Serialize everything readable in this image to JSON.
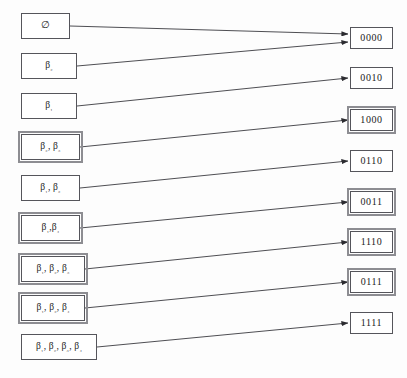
{
  "diagram": {
    "type": "bipartite-mapping",
    "stroke_color": "#3a3a3f",
    "box_border_color": "#55555b",
    "box_double_border_color": "#8d8d92",
    "background_color": "#fdfdfd"
  },
  "left_nodes": [
    {
      "id": "L0",
      "label": "∅",
      "border": "single",
      "x": 21,
      "y": 13,
      "w": 49,
      "h": 26
    },
    {
      "id": "L1",
      "label": "β₂",
      "border": "single",
      "x": 21,
      "y": 53,
      "w": 56,
      "h": 26
    },
    {
      "id": "L2",
      "label": "β₁",
      "border": "single",
      "x": 21,
      "y": 93,
      "w": 56,
      "h": 26
    },
    {
      "id": "L3",
      "label": "β₂, β₃",
      "border": "double",
      "x": 21,
      "y": 134,
      "w": 59,
      "h": 26
    },
    {
      "id": "L4",
      "label": "β₁, β₂",
      "border": "single",
      "x": 21,
      "y": 175,
      "w": 59,
      "h": 26
    },
    {
      "id": "L5",
      "label": "β₁,β₄",
      "border": "double",
      "x": 21,
      "y": 215,
      "w": 59,
      "h": 26
    },
    {
      "id": "L6",
      "label": "β₁, β₂, β₃",
      "border": "double",
      "x": 21,
      "y": 256,
      "w": 64,
      "h": 26
    },
    {
      "id": "L7",
      "label": "β₁, β₂, β₄",
      "border": "double",
      "x": 21,
      "y": 295,
      "w": 64,
      "h": 26
    },
    {
      "id": "L8",
      "label": "β₁, β₂, β₃, β₄",
      "border": "single",
      "x": 21,
      "y": 334,
      "w": 76,
      "h": 26
    }
  ],
  "right_nodes": [
    {
      "id": "R0",
      "label": "0000",
      "border": "single",
      "x": 350,
      "y": 27,
      "w": 43,
      "h": 22
    },
    {
      "id": "R1",
      "label": "0010",
      "border": "single",
      "x": 350,
      "y": 67,
      "w": 43,
      "h": 22
    },
    {
      "id": "R2",
      "label": "1000",
      "border": "double",
      "x": 350,
      "y": 109,
      "w": 43,
      "h": 22
    },
    {
      "id": "R3",
      "label": "0110",
      "border": "single",
      "x": 350,
      "y": 150,
      "w": 43,
      "h": 22
    },
    {
      "id": "R4",
      "label": "0011",
      "border": "double",
      "x": 350,
      "y": 191,
      "w": 43,
      "h": 22
    },
    {
      "id": "R5",
      "label": "1110",
      "border": "double",
      "x": 350,
      "y": 231,
      "w": 43,
      "h": 22
    },
    {
      "id": "R6",
      "label": "0111",
      "border": "double",
      "x": 350,
      "y": 271,
      "w": 43,
      "h": 22
    },
    {
      "id": "R7",
      "label": "1111",
      "border": "single",
      "x": 350,
      "y": 312,
      "w": 43,
      "h": 22
    }
  ],
  "edges": [
    {
      "id": "E0",
      "from": "L0",
      "to": "R0",
      "from_label": "∅",
      "to_label": "0000"
    },
    {
      "id": "E1",
      "from": "L1",
      "to": "R0",
      "from_label": "β₂",
      "to_label": "0000"
    },
    {
      "id": "E2",
      "from": "L2",
      "to": "R1",
      "from_label": "β₁",
      "to_label": "0010"
    },
    {
      "id": "E3",
      "from": "L3",
      "to": "R2",
      "from_label": "β₂, β₃",
      "to_label": "1000"
    },
    {
      "id": "E4",
      "from": "L4",
      "to": "R3",
      "from_label": "β₁, β₂",
      "to_label": "0110"
    },
    {
      "id": "E5",
      "from": "L5",
      "to": "R4",
      "from_label": "β₁,β₄",
      "to_label": "0011"
    },
    {
      "id": "E6",
      "from": "L6",
      "to": "R5",
      "from_label": "β₁, β₂, β₃",
      "to_label": "1110"
    },
    {
      "id": "E7",
      "from": "L7",
      "to": "R6",
      "from_label": "β₁, β₂, β₄",
      "to_label": "0111"
    },
    {
      "id": "E8",
      "from": "L8",
      "to": "R7",
      "from_label": "β₁, β₂, β₃, β₄",
      "to_label": "1111"
    }
  ]
}
